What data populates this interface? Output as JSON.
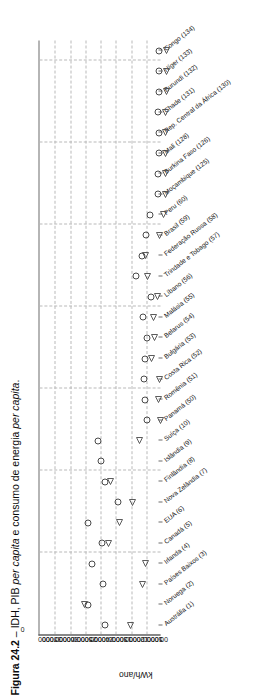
{
  "figure": {
    "number": "Figura 24.2",
    "dash": "–",
    "title_plain": "IDH, PIB ",
    "title_ital_1": "per capita",
    "title_mid": " e consumo de energia ",
    "title_ital_2": "per capita",
    "title_end": ".",
    "full_caption": "Figura 24.2 – IDH, PIB per capita e consumo de energia per capita."
  },
  "axes": {
    "y_left_title": "kWh/ano",
    "y_left_ticks": [
      "35000",
      "30000",
      "25000",
      "20000",
      "15000",
      "10000",
      "5000",
      "0"
    ],
    "y_right_ticks": [
      "70000",
      "60000",
      "50000",
      "40000",
      "30000",
      "20000",
      "10000",
      "0"
    ],
    "y_left_max": 35000,
    "y_right_max": 70000,
    "zero_label": "0"
  },
  "chart_data": {
    "type": "scatter",
    "title": "Figura 24.2 – IDH, PIB per capita e consumo de energia per capita.",
    "xlabel": "",
    "ylabel": "kWh/ano",
    "ylim": [
      0,
      35000
    ],
    "y2lim": [
      0,
      70000
    ],
    "grid": true,
    "legend": "none",
    "categories": [
      "Austrália (1)",
      "Noruega (2)",
      "Países Baixos (3)",
      "Irlanda (4)",
      "Canadá (5)",
      "EUA (6)",
      "Nova Zelândia (7)",
      "Finlândia (8)",
      "Islândia (9)",
      "Suíça (10)",
      "Panamá (50)",
      "Romênia (51)",
      "Costa Rica (52)",
      "Bulgária (53)",
      "Belarus (54)",
      "Malásia (55)",
      "Líbano (56)",
      "Trindade e Tobago (57)",
      "Federação Russa (58)",
      "Brasil (59)",
      "Peru (60)",
      "Moçambique (125)",
      "Burkina Faso (126)",
      "Mali (128)",
      "Rep. Central da África (130)",
      "Chade (131)",
      "Burundi (132)",
      "Níger (133)",
      "Congo (134)"
    ],
    "series": [
      {
        "name": "kWh/ano",
        "marker": "triangle",
        "values": [
          10200,
          23500,
          7000,
          6000,
          16500,
          13500,
          9800,
          16200,
          52000,
          7800,
          1800,
          2400,
          1900,
          4300,
          3300,
          3600,
          2600,
          5400,
          6000,
          2100,
          1000,
          420,
          260,
          200,
          170,
          150,
          130,
          120,
          120
        ]
      },
      {
        "name": "PIB per capita",
        "marker": "circle",
        "values": [
          31800,
          41800,
          33200,
          39300,
          33500,
          41800,
          24200,
          32100,
          34300,
          35600,
          7500,
          8800,
          9500,
          9000,
          7800,
          10200,
          5600,
          14000,
          10800,
          8400,
          6000,
          1300,
          1200,
          1000,
          1100,
          1400,
          700,
          800,
          700
        ]
      }
    ]
  }
}
